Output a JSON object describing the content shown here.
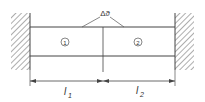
{
  "diagram": {
    "type": "bar-between-fixed-walls",
    "temperature_label": "Δϑ",
    "segments": [
      {
        "id": "segment-1",
        "number": "1",
        "length_label": "l",
        "length_sub": "1"
      },
      {
        "id": "segment-2",
        "number": "2",
        "length_label": "l",
        "length_sub": "2"
      }
    ],
    "colors": {
      "line": "#444444",
      "hatch": "#777777",
      "background": "#ffffff"
    }
  }
}
